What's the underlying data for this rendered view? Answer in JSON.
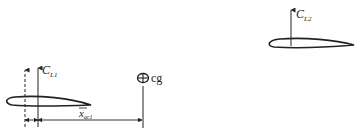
{
  "diagram": {
    "type": "aerodynamic-center-cg-schematic",
    "labels": {
      "lift1": {
        "base": "C",
        "sub": "L1"
      },
      "lift2": {
        "base": "C",
        "sub": "L2"
      },
      "cg": "cg",
      "distance": {
        "base": "x",
        "sub": "ac1",
        "overbar": true
      }
    },
    "elements": [
      {
        "name": "airfoil-1",
        "leading_edge": [
          5,
          101
        ],
        "trailing_edge": [
          91,
          105
        ]
      },
      {
        "name": "airfoil-2",
        "leading_edge": [
          268,
          44
        ],
        "trailing_edge": [
          354,
          45
        ]
      },
      {
        "name": "lift-vector-1",
        "style": "solid",
        "x": 38
      },
      {
        "name": "reference-vector-1",
        "style": "dashed",
        "x": 25
      },
      {
        "name": "lift-vector-2",
        "style": "solid",
        "x": 291
      },
      {
        "name": "cg-symbol",
        "center": [
          143,
          78
        ]
      }
    ],
    "colors": {
      "stroke": "#222222",
      "background": "#ffffff"
    }
  }
}
